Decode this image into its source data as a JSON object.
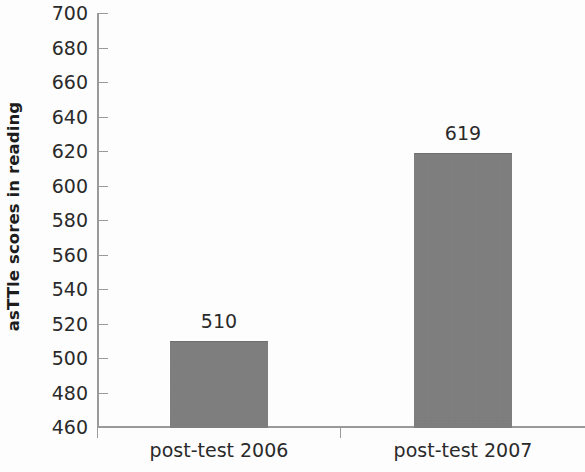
{
  "chart_data": {
    "type": "bar",
    "title": "",
    "subtitle": "",
    "xlabel": "",
    "ylabel": "asTTle scores in reading",
    "categories": [
      "post-test 2006",
      "post-test 2007"
    ],
    "values": [
      510,
      619
    ],
    "data_labels": [
      "510",
      "619"
    ],
    "ylim": [
      460,
      700
    ],
    "ytick_step": 20,
    "ytick_labels": [
      "700",
      "680",
      "660",
      "640",
      "620",
      "600",
      "580",
      "560",
      "540",
      "520",
      "500",
      "480",
      "460"
    ],
    "ytick_values": [
      700,
      680,
      660,
      640,
      620,
      600,
      580,
      560,
      540,
      520,
      500,
      480,
      460
    ],
    "grid": false,
    "legend": null,
    "legend_position": "none",
    "series": [
      {
        "name": "asTTle reading score",
        "values": [
          510,
          619
        ],
        "color": "#7e7e7e"
      }
    ],
    "annotations": []
  },
  "style": {
    "bar_color": "#7e7e7e",
    "axis_color": "#9a9a9a",
    "text_color": "#2a2a2a",
    "background": "#fdfdfd"
  }
}
